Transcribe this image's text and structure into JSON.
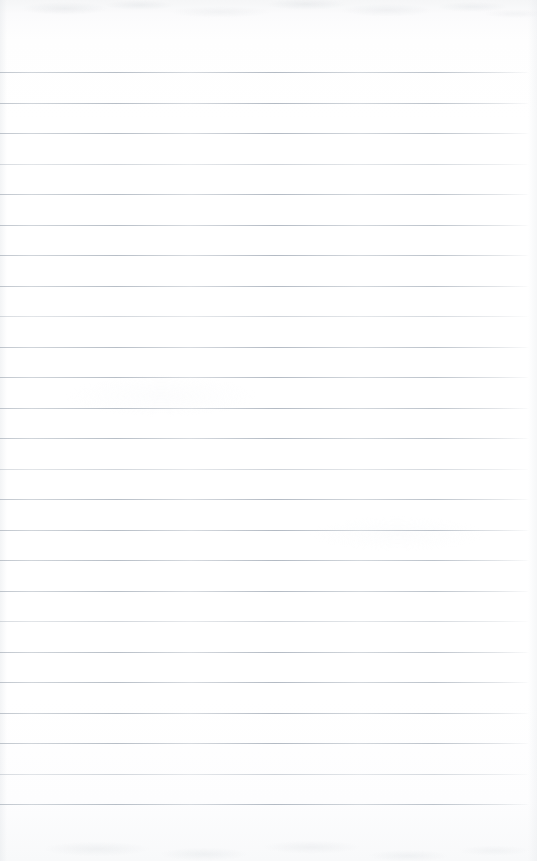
{
  "document": {
    "type": "scanned-blank-ruled-notebook-page",
    "title": "",
    "visible_text": "",
    "page_width_px": 537,
    "page_height_px": 861,
    "paper_color": "#fefefe",
    "rule_color": "#a8b0ba",
    "has_handwriting": false,
    "has_printed_text": false,
    "has_images": false
  },
  "ruling": {
    "line_count": 25,
    "first_line_y": 72,
    "line_spacing_px": 30.5,
    "last_line_y": 822,
    "line_start_x": 0,
    "line_end_x": 529,
    "line_thickness_px": 1,
    "orientation": "horizontal",
    "margin_rule": "none",
    "lines_y": [
      72,
      102.5,
      133,
      163.5,
      194,
      224.5,
      255,
      285.5,
      316,
      346.5,
      377,
      407.5,
      438,
      468.5,
      499,
      529.5,
      560,
      590.5,
      621,
      651.5,
      682,
      712.5,
      743,
      773.5,
      804
    ]
  },
  "margins": {
    "top_blank_px": 72,
    "bottom_blank_px": 39,
    "left_blank_px": 0,
    "right_blank_px": 8
  },
  "scan_artifacts": {
    "top_edge_mottling": true,
    "bottom_edge_mottling": true,
    "left_edge_shading": true,
    "right_edge_fade": true
  }
}
